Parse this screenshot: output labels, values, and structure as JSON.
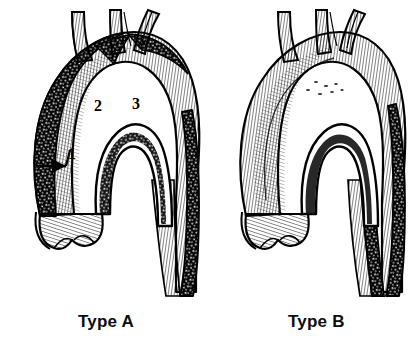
{
  "figure": {
    "background_color": "#ffffff",
    "ink_color": "#000000",
    "panels": [
      {
        "id": "type-a",
        "caption": "Type A",
        "description": "Dissection involving the ascending aorta, aortic arch and descending aorta",
        "callouts": [
          {
            "label": "1",
            "x": 72,
            "y": 155,
            "target": "intimal tear in ascending aorta",
            "has_arrow": true
          },
          {
            "label": "2",
            "x": 98,
            "y": 107,
            "target": "left common carotid artery origin",
            "has_arrow": false
          },
          {
            "label": "3",
            "x": 136,
            "y": 105,
            "target": "left subclavian artery origin",
            "has_arrow": false
          }
        ]
      },
      {
        "id": "type-b",
        "caption": "Type B",
        "description": "Dissection confined to the descending aorta distal to the left subclavian artery",
        "callouts": []
      }
    ],
    "arch_vessels": [
      "brachiocephalic trunk",
      "left common carotid artery",
      "left subclavian artery"
    ]
  }
}
